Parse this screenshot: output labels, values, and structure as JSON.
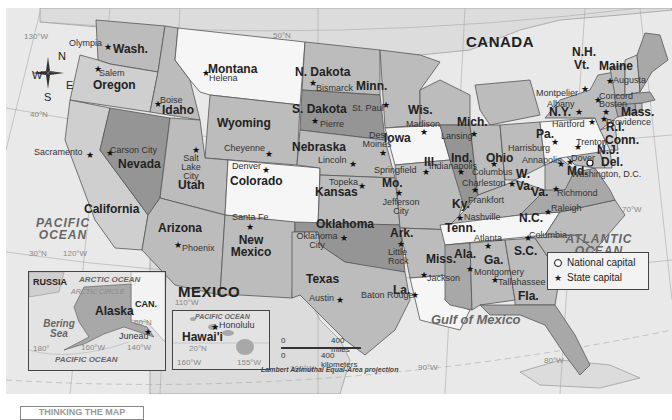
{
  "map": {
    "countries": {
      "canada": "CANADA",
      "mexico": "MEXICO",
      "russia": "RUSSIA",
      "can_abbr": "CAN."
    },
    "oceans": {
      "pacific": "PACIFIC OCEAN",
      "atlantic": "ATLANTIC OCEAN",
      "gulf": "Gulf of Mexico",
      "arctic": "ARCTIC OCEAN",
      "arctic_circle": "ARCTIC CIRCLE",
      "bering": "Bering Sea",
      "pacific_inset": "PACIFIC OCEAN",
      "pacific_hawaii": "PACIFIC OCEAN"
    },
    "grid_labels": {
      "lon130": "130°W",
      "lon120": "120°W",
      "lon110": "110°W",
      "lon100": "100°W",
      "lon90": "90°W",
      "lon80": "80°W",
      "lon70": "70°W",
      "lat50": "50°N",
      "lat40": "40°N",
      "lat30": "30°N",
      "ak180": "180°",
      "ak160": "160°W",
      "ak140": "140°W",
      "ak60": "60°N",
      "hi160": "160°W",
      "hi155": "155°W",
      "hi20": "20°N"
    },
    "compass": {
      "n": "N",
      "s": "S",
      "e": "E",
      "w": "W"
    },
    "states": [
      {
        "name": "Wash.",
        "capital": "Olympia"
      },
      {
        "name": "Oregon",
        "capital": "Salem"
      },
      {
        "name": "California",
        "capital": "Sacramento"
      },
      {
        "name": "Nevada",
        "capital": "Carson City"
      },
      {
        "name": "Idaho",
        "capital": "Boise"
      },
      {
        "name": "Montana",
        "capital": "Helena"
      },
      {
        "name": "Wyoming",
        "capital": "Cheyenne"
      },
      {
        "name": "Utah",
        "capital": "Salt Lake City"
      },
      {
        "name": "Arizona",
        "capital": "Phoenix"
      },
      {
        "name": "Colorado",
        "capital": "Denver"
      },
      {
        "name": "New Mexico",
        "capital": "Santa Fe"
      },
      {
        "name": "N. Dakota",
        "capital": "Bismarck"
      },
      {
        "name": "S. Dakota",
        "capital": "Pierre"
      },
      {
        "name": "Nebraska",
        "capital": "Lincoln"
      },
      {
        "name": "Kansas",
        "capital": "Topeka"
      },
      {
        "name": "Oklahoma",
        "capital": "Oklahoma City"
      },
      {
        "name": "Texas",
        "capital": "Austin"
      },
      {
        "name": "Minn.",
        "capital": "St. Paul"
      },
      {
        "name": "Iowa",
        "capital": "Des Moines"
      },
      {
        "name": "Mo.",
        "capital": "Jefferson City"
      },
      {
        "name": "Ark.",
        "capital": "Little Rock"
      },
      {
        "name": "La.",
        "capital": "Baton Rouge"
      },
      {
        "name": "Wis.",
        "capital": "Madison"
      },
      {
        "name": "Ill.",
        "capital": "Springfield"
      },
      {
        "name": "Miss.",
        "capital": "Jackson"
      },
      {
        "name": "Mich.",
        "capital": "Lansing"
      },
      {
        "name": "Ind.",
        "capital": "Indianapolis"
      },
      {
        "name": "Ky.",
        "capital": "Frankfort"
      },
      {
        "name": "Tenn.",
        "capital": "Nashville"
      },
      {
        "name": "Ala.",
        "capital": "Montgomery"
      },
      {
        "name": "Ohio",
        "capital": "Columbus"
      },
      {
        "name": "W. Va.",
        "capital": "Charleston"
      },
      {
        "name": "Ga.",
        "capital": "Atlanta"
      },
      {
        "name": "Fla.",
        "capital": "Tallahassee"
      },
      {
        "name": "S.C.",
        "capital": "Columbia"
      },
      {
        "name": "N.C.",
        "capital": "Raleigh"
      },
      {
        "name": "Va.",
        "capital": "Richmond"
      },
      {
        "name": "Md.",
        "capital": "Annapolis"
      },
      {
        "name": "Del.",
        "capital": "Dover"
      },
      {
        "name": "Pa.",
        "capital": "Harrisburg"
      },
      {
        "name": "N.J.",
        "capital": "Trenton"
      },
      {
        "name": "N.Y.",
        "capital": "Albany"
      },
      {
        "name": "Conn.",
        "capital": "Hartford"
      },
      {
        "name": "R.I.",
        "capital": "Providence"
      },
      {
        "name": "Mass.",
        "capital": "Boston"
      },
      {
        "name": "Vt.",
        "capital": "Montpelier"
      },
      {
        "name": "N.H.",
        "capital": "Concord"
      },
      {
        "name": "Maine",
        "capital": "Augusta"
      },
      {
        "name": "Alaska",
        "capital": "Juneau"
      },
      {
        "name": "Hawai'i",
        "capital": "Honolulu"
      }
    ],
    "national_capital": "Washington, D.C.",
    "legend": {
      "national": "National capital",
      "state": "State capital"
    },
    "scale": {
      "zero_mi": "0",
      "miles": "400 miles",
      "zero_km": "0",
      "km": "400 kilometers"
    },
    "projection": "Lambert Azimuthal Equal-Area projection",
    "footer": "THINKING THE MAP"
  }
}
